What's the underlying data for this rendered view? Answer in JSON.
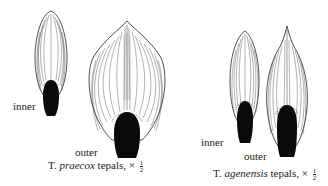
{
  "figures": [
    {
      "species_abbrev": "T.",
      "species_epithet": "praecox",
      "caption_suffix": "tepals, ×",
      "scale_num": "1",
      "scale_den": "2",
      "labels": {
        "inner": "inner",
        "outer": "outer"
      }
    },
    {
      "species_abbrev": "T.",
      "species_epithet": "agenensis",
      "caption_suffix": "tepals, ×",
      "scale_num": "1",
      "scale_den": "2",
      "labels": {
        "inner": "inner",
        "outer": "outer"
      }
    }
  ],
  "colors": {
    "ink": "#111111",
    "paper": "#ffffff",
    "vein": "#555555"
  }
}
